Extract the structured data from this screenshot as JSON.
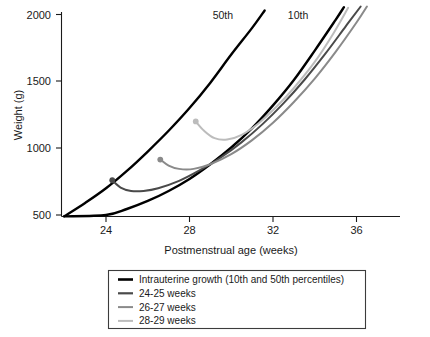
{
  "chart_data": {
    "type": "line",
    "title": "",
    "xlabel": "Postmenstrual age (weeks)",
    "ylabel": "Weight (g)",
    "xlim": [
      21.7,
      38.5
    ],
    "ylim": [
      440,
      2050
    ],
    "xticks": [
      24,
      28,
      32,
      36
    ],
    "yticks": [
      500,
      1000,
      1500,
      2000
    ],
    "xtick_labels": [
      "24",
      "28",
      "32",
      "36"
    ],
    "ytick_labels": [
      "500",
      "1000",
      "1500",
      "2000"
    ],
    "grid": false,
    "legend_position": "below-plot",
    "annotations": [
      {
        "text": "50th",
        "x": 29.6,
        "y": 2000,
        "series": "intrauterine-50th"
      },
      {
        "text": "10th",
        "x": 33.2,
        "y": 2000,
        "series": "intrauterine-10th"
      }
    ],
    "series": [
      {
        "name": "Intrauterine growth 50th percentile",
        "color": "#000000",
        "width": 2.4,
        "marker": "none",
        "points": [
          [
            22.0,
            490
          ],
          [
            23.0,
            590
          ],
          [
            24.0,
            700
          ],
          [
            25.0,
            830
          ],
          [
            26.0,
            975
          ],
          [
            27.0,
            1130
          ],
          [
            28.0,
            1300
          ],
          [
            29.0,
            1490
          ],
          [
            30.0,
            1700
          ],
          [
            31.0,
            1900
          ],
          [
            31.6,
            2030
          ]
        ]
      },
      {
        "name": "Intrauterine growth 10th percentile",
        "color": "#000000",
        "width": 2.4,
        "marker": "none",
        "points": [
          [
            22.0,
            490
          ],
          [
            24.0,
            500
          ],
          [
            25.0,
            545
          ],
          [
            26.0,
            605
          ],
          [
            27.0,
            680
          ],
          [
            28.0,
            770
          ],
          [
            29.0,
            880
          ],
          [
            30.0,
            1005
          ],
          [
            31.0,
            1150
          ],
          [
            32.0,
            1320
          ],
          [
            33.0,
            1510
          ],
          [
            34.0,
            1730
          ],
          [
            35.0,
            1960
          ],
          [
            35.4,
            2055
          ]
        ]
      },
      {
        "name": "24-25 weeks",
        "color": "#4a4a4a",
        "width": 2.0,
        "marker": "dot-at-start",
        "points": [
          [
            24.3,
            760
          ],
          [
            24.7,
            705
          ],
          [
            25.2,
            680
          ],
          [
            25.8,
            680
          ],
          [
            26.5,
            700
          ],
          [
            27.5,
            755
          ],
          [
            28.5,
            835
          ],
          [
            29.5,
            930
          ],
          [
            30.5,
            1045
          ],
          [
            31.5,
            1180
          ],
          [
            32.5,
            1335
          ],
          [
            33.5,
            1510
          ],
          [
            34.5,
            1705
          ],
          [
            35.5,
            1915
          ],
          [
            36.2,
            2060
          ]
        ]
      },
      {
        "name": "26-27 weeks",
        "color": "#8a8a8a",
        "width": 2.0,
        "marker": "dot-at-start",
        "points": [
          [
            26.6,
            915
          ],
          [
            27.0,
            870
          ],
          [
            27.5,
            845
          ],
          [
            28.2,
            845
          ],
          [
            29.0,
            880
          ],
          [
            30.0,
            955
          ],
          [
            31.0,
            1060
          ],
          [
            32.0,
            1190
          ],
          [
            33.0,
            1345
          ],
          [
            34.0,
            1520
          ],
          [
            35.0,
            1720
          ],
          [
            36.0,
            1940
          ],
          [
            36.5,
            2060
          ]
        ]
      },
      {
        "name": "28-29 weeks",
        "color": "#bcbcbc",
        "width": 2.0,
        "marker": "dot-at-start",
        "points": [
          [
            28.3,
            1200
          ],
          [
            28.7,
            1130
          ],
          [
            29.2,
            1075
          ],
          [
            29.8,
            1065
          ],
          [
            30.5,
            1100
          ],
          [
            31.3,
            1185
          ],
          [
            32.2,
            1315
          ],
          [
            33.0,
            1450
          ],
          [
            34.0,
            1645
          ],
          [
            34.9,
            1860
          ],
          [
            35.6,
            2050
          ]
        ]
      }
    ],
    "legend": {
      "entries": [
        {
          "label": "Intrauterine growth (10th and 50th percentiles)",
          "color": "#000000",
          "width": 2.6
        },
        {
          "label": "24-25 weeks",
          "color": "#4a4a4a",
          "width": 2.2
        },
        {
          "label": "26-27 weeks",
          "color": "#8a8a8a",
          "width": 2.0
        },
        {
          "label": "28-29 weeks",
          "color": "#bcbcbc",
          "width": 2.0
        }
      ]
    }
  }
}
